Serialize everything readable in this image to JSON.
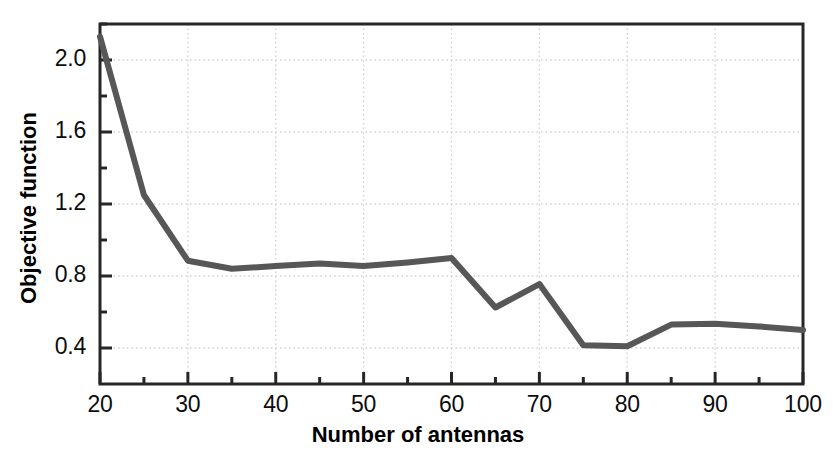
{
  "chart_data": {
    "type": "line",
    "title": "",
    "xlabel": "Number of antennas",
    "ylabel": "Objective function",
    "xlim": [
      20,
      100
    ],
    "ylim": [
      0.2,
      2.2
    ],
    "grid": true,
    "legend": null,
    "line_color": "#575757",
    "x": [
      20,
      25,
      30,
      35,
      40,
      45,
      50,
      55,
      60,
      65,
      70,
      75,
      80,
      85,
      90,
      95,
      100
    ],
    "values": [
      2.13,
      1.25,
      0.885,
      0.84,
      0.855,
      0.87,
      0.855,
      0.875,
      0.9,
      0.625,
      0.755,
      0.415,
      0.41,
      0.53,
      0.535,
      0.52,
      0.5
    ],
    "series": [
      {
        "name": "Objective function",
        "values": [
          2.13,
          1.25,
          0.885,
          0.84,
          0.855,
          0.87,
          0.855,
          0.875,
          0.9,
          0.625,
          0.755,
          0.415,
          0.41,
          0.53,
          0.535,
          0.52,
          0.5
        ]
      }
    ],
    "x_ticks": [
      20,
      30,
      40,
      50,
      60,
      70,
      80,
      90,
      100
    ],
    "x_tick_labels": [
      "20",
      "30",
      "40",
      "50",
      "60",
      "70",
      "80",
      "90",
      "100"
    ],
    "x_minor_ticks": [
      25,
      35,
      45,
      55,
      65,
      75,
      85,
      95
    ],
    "y_ticks": [
      0.4,
      0.8,
      1.2,
      1.6,
      2.0
    ],
    "y_tick_labels": [
      "0.4",
      "0.8",
      "1.2",
      "1.6",
      "2.0"
    ],
    "y_minor_ticks": [
      0.6,
      1.0,
      1.4,
      1.8,
      2.2
    ]
  }
}
